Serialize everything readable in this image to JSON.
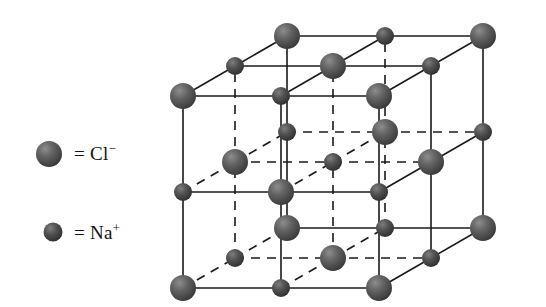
{
  "figure": {
    "name": "sodium-chloride-crystal-lattice",
    "background_color": "#ffffff",
    "line_color": "#1a1a1a"
  },
  "legend": {
    "items": [
      {
        "key": "chloride",
        "marker": "large-sphere",
        "equals": "=",
        "label": "Cl",
        "charge": "−",
        "full_text": "= Cl⁻",
        "sphere_diameter_px": 26,
        "sphere_color": "#585858"
      },
      {
        "key": "sodium",
        "marker": "small-sphere",
        "equals": "=",
        "label": "Na",
        "charge": "+",
        "full_text": "= Na⁺",
        "sphere_diameter_px": 19,
        "sphere_color": "#4a4a4a"
      }
    ]
  },
  "lattice": {
    "type": "rock-salt",
    "grid": 3,
    "cell_step_x": 98,
    "cell_step_y": -96,
    "depth_dx": 52,
    "depth_dy": -30,
    "origin_x": 183,
    "origin_y": 288,
    "large_radius": 13,
    "small_radius": 9,
    "large_color": "#5c5c5c",
    "small_color": "#4a4a4a",
    "edge_color": "#1a1a1a",
    "solid_edge_width": 1.6,
    "dashed_edge_width": 1.6,
    "dash_pattern": "9,7"
  }
}
